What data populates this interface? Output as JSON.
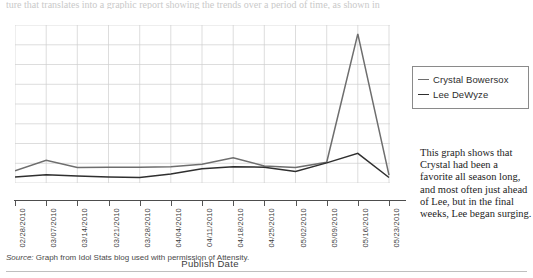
{
  "top_fragment": "ture that translates into a graphic report showing the trends over a period of time, as shown in",
  "legend": {
    "items": [
      {
        "label": "Crystal Bowersox",
        "color": "#6e6e6e"
      },
      {
        "label": "Lee DeWyze",
        "color": "#2f2f2f"
      }
    ]
  },
  "caption": "This graph shows that Crystal had been a favorite all season long, and most often just ahead of Lee, but in the final weeks, Lee began surging.",
  "source": {
    "label": "Source:",
    "text": "Graph from Idol Stats blog used with permission of Attensity."
  },
  "chart_data": {
    "type": "line",
    "title": "",
    "xlabel": "Publish Date",
    "ylabel": "",
    "grid": true,
    "legend_position": "right",
    "ylim": [
      0,
      8
    ],
    "gridlines_y": 8,
    "categories": [
      "02/28/2010",
      "03/07/2010",
      "03/14/2010",
      "03/21/2010",
      "03/28/2010",
      "04/04/2010",
      "04/11/2010",
      "04/18/2010",
      "04/25/2010",
      "05/02/2010",
      "05/09/2010",
      "05/16/2010",
      "05/23/2010"
    ],
    "series": [
      {
        "name": "Crystal Bowersox",
        "color": "#6e6e6e",
        "values": [
          0.62,
          1.15,
          0.78,
          0.8,
          0.8,
          0.82,
          0.95,
          1.28,
          0.86,
          0.78,
          1.05,
          7.55,
          0.4
        ]
      },
      {
        "name": "Lee DeWyze",
        "color": "#2f2f2f",
        "values": [
          0.3,
          0.42,
          0.35,
          0.3,
          0.28,
          0.46,
          0.72,
          0.82,
          0.8,
          0.58,
          1.02,
          1.5,
          0.28
        ]
      }
    ]
  }
}
